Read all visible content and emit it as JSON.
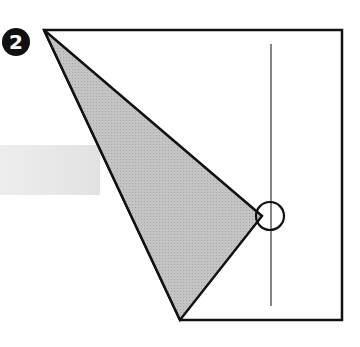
{
  "diagram": {
    "step_number": "2",
    "colors": {
      "line": "#111111",
      "fold_fill": "#b9b9b9",
      "band_fill": "#e6e6e6",
      "paper": "#ffffff"
    },
    "paper_outline": "44,30 342,30 342,320 180,320",
    "folded_flap": "44,30 262,216 180,320",
    "crease_line": {
      "x": 271,
      "y1": 44,
      "y2": 306
    },
    "reference_circle": {
      "cx": 270,
      "cy": 216,
      "r": 14
    },
    "background_band": {
      "x": 0,
      "y": 145,
      "width": 100,
      "height": 50
    }
  }
}
